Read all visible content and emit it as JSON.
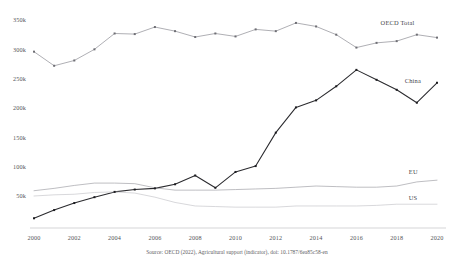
{
  "chart_data": {
    "type": "line",
    "title": "",
    "xlabel": "",
    "ylabel": "",
    "x": [
      2000,
      2001,
      2002,
      2003,
      2004,
      2005,
      2006,
      2007,
      2008,
      2009,
      2010,
      2011,
      2012,
      2013,
      2014,
      2015,
      2016,
      2017,
      2018,
      2019,
      2020
    ],
    "xlim": [
      2000,
      2020
    ],
    "ylim": [
      0,
      360000
    ],
    "ytick_values": [
      50000,
      100000,
      150000,
      200000,
      250000,
      300000,
      350000
    ],
    "ytick_labels": [
      "50k",
      "100k",
      "150k",
      "200k",
      "250k",
      "300k",
      "350k"
    ],
    "xtick_values": [
      2000,
      2002,
      2004,
      2006,
      2008,
      2010,
      2012,
      2014,
      2016,
      2018,
      2020
    ],
    "xtick_labels": [
      "2000",
      "2002",
      "2004",
      "2006",
      "2008",
      "2010",
      "2012",
      "2014",
      "2016",
      "2018",
      "2020"
    ],
    "grid": false,
    "legend_position": "right-inline-labels",
    "series": [
      {
        "name": "OECD Total",
        "color": "#8d8d93",
        "markers": true,
        "label_anchor": {
          "year": 2017.2,
          "value": 342000
        },
        "values": [
          296000,
          272000,
          281000,
          300000,
          327000,
          326000,
          338000,
          331000,
          321000,
          327000,
          322000,
          334000,
          331000,
          345000,
          339000,
          325000,
          303000,
          311000,
          314000,
          325000,
          320000
        ]
      },
      {
        "name": "China",
        "color": "#2a2a2e",
        "markers": true,
        "label_anchor": {
          "year": 2018.4,
          "value": 242000
        },
        "values": [
          12000,
          26000,
          38000,
          48000,
          57000,
          61000,
          63000,
          70000,
          85000,
          64000,
          91000,
          101000,
          158000,
          201000,
          213000,
          237000,
          265000,
          248000,
          231000,
          209000,
          243000
        ]
      },
      {
        "name": "EU",
        "color": "#9b9ba1",
        "markers": false,
        "label_anchor": {
          "year": 2018.6,
          "value": 88000
        },
        "values": [
          59000,
          63000,
          68000,
          72000,
          72000,
          71000,
          64000,
          60000,
          60000,
          60000,
          61000,
          62000,
          63000,
          65000,
          67000,
          66000,
          65000,
          65000,
          67000,
          74000,
          77000
        ]
      },
      {
        "name": "US",
        "color": "#c2c2c7",
        "markers": false,
        "label_anchor": {
          "year": 2018.6,
          "value": 43000
        },
        "values": [
          50000,
          52000,
          53000,
          56000,
          57000,
          55000,
          48000,
          39000,
          33000,
          32000,
          31000,
          31000,
          31000,
          33000,
          33000,
          33000,
          33000,
          34000,
          36000,
          36000,
          36000
        ]
      }
    ],
    "source_note": "Source: OECD (2022), Agricultural support (indicator), doi: 10.1787/6ea85c58-en"
  }
}
